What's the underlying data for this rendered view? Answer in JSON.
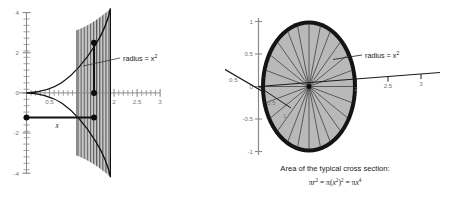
{
  "figure": {
    "title": "",
    "left_plot": {
      "name": "solid-of-revolution-cross-section-plot",
      "x_axis": {
        "label": "x",
        "ticks": [
          "0.5",
          "1",
          "1.5",
          "2",
          "2.5",
          "3"
        ],
        "tick_values": [
          0.5,
          1,
          1.5,
          2,
          2.5,
          3
        ],
        "range": [
          -0.1,
          3.2
        ],
        "minor_tick_step": 0.1
      },
      "y_axis": {
        "ticks": [
          "4",
          "2",
          "0",
          "-2",
          "-4"
        ],
        "tick_values": [
          4,
          2,
          0,
          -2,
          -4
        ],
        "range": [
          -4.6,
          4.6
        ],
        "minor_tick_step": 0.4
      },
      "curves": [
        {
          "name": "upper-curve",
          "expression": "x^2",
          "domain": [
            0,
            2.05
          ]
        },
        {
          "name": "lower-curve",
          "expression": "-x^2",
          "domain": [
            0,
            2.05
          ]
        }
      ],
      "shaded_region": {
        "x_from": 1.22,
        "x_to": 2.05,
        "hatch": "vertical-lines"
      },
      "annotations": [
        {
          "name": "radius-label",
          "text": "radius = x",
          "sup": "2"
        },
        {
          "name": "x-segment-label",
          "text": "x"
        }
      ],
      "markers": [
        {
          "name": "origin-dot",
          "x": 0.0,
          "y": -1.22
        },
        {
          "name": "radius-top-dot",
          "x": 1.58,
          "y": 2.5
        },
        {
          "name": "axis-dot",
          "x": 1.58,
          "y": 0.0
        },
        {
          "name": "radius-bottom-dot",
          "x": 1.58,
          "y": -1.22
        }
      ]
    },
    "right_plot": {
      "name": "typical-cross-section-disk-plot",
      "x_axis": {
        "ticks": [
          "2",
          "2.5",
          "3"
        ],
        "tick_values": [
          2,
          2.5,
          3
        ]
      },
      "y_axis": {
        "ticks": [
          "1",
          "0.5",
          "0",
          "-0.5",
          "-1"
        ],
        "tick_values": [
          1,
          0.5,
          0,
          -0.5,
          -1
        ]
      },
      "depth_axis": {
        "ticks": [
          "0.5",
          "1"
        ],
        "inner_tick": "0.5",
        "outer_tick": "0.5"
      },
      "disk": {
        "name": "cross-section-disk",
        "radius_spokes": 24,
        "fill_color": "#b9b9b9",
        "edge_color": "#141414",
        "edge_width": 6
      },
      "annotations": [
        {
          "name": "radius-label",
          "text": "radius = x",
          "sup": "2"
        }
      ],
      "caption": {
        "line1": "Area of the typical cross section:",
        "formula_parts": [
          {
            "sym": "π",
            "base": "r",
            "sup": "2"
          },
          {
            "op": "="
          },
          {
            "sym": "π",
            "base": "(x",
            "sup_inner": "2",
            "close": ")",
            "sup": "2"
          },
          {
            "op": "="
          },
          {
            "sym": "π",
            "base": "x",
            "sup": "4"
          }
        ],
        "formula_plain": "πr² = π(x²)² = πx⁴"
      }
    },
    "colors": {
      "axis": "#8a8a8a",
      "tick_text": "#777777",
      "curve": "#111111",
      "shade_fill": "#c9c9c9",
      "hatch": "#555555",
      "disk_fill": "#b9b9b9",
      "disk_edge": "#141414",
      "text": "#1a1a1a",
      "background": "#ffffff"
    }
  }
}
